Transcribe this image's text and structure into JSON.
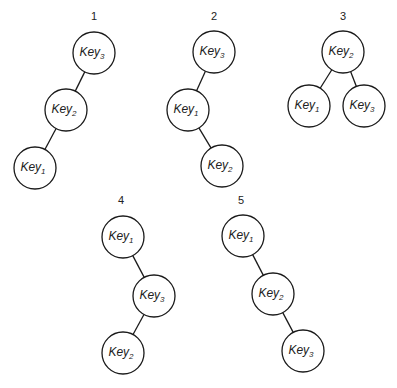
{
  "diagram": {
    "title": "",
    "node_radius": 21,
    "colors": {
      "stroke": "#1a1a1a",
      "fill": "#ffffff",
      "text": "#222222"
    },
    "trees": [
      {
        "label": "1",
        "label_pos": [
          94,
          20
        ],
        "nodes": [
          {
            "id": "k3",
            "text": "Key",
            "sub": "3",
            "x": 94,
            "y": 53
          },
          {
            "id": "k2",
            "text": "Key",
            "sub": "2",
            "x": 66,
            "y": 110
          },
          {
            "id": "k1",
            "text": "Key",
            "sub": "1",
            "x": 35,
            "y": 168
          }
        ],
        "edges": [
          [
            "k3",
            "k2"
          ],
          [
            "k2",
            "k1"
          ]
        ]
      },
      {
        "label": "2",
        "label_pos": [
          214,
          20
        ],
        "nodes": [
          {
            "id": "k3",
            "text": "Key",
            "sub": "3",
            "x": 214,
            "y": 52
          },
          {
            "id": "k1",
            "text": "Key",
            "sub": "1",
            "x": 188,
            "y": 110
          },
          {
            "id": "k2",
            "text": "Key",
            "sub": "2",
            "x": 222,
            "y": 166
          }
        ],
        "edges": [
          [
            "k3",
            "k1"
          ],
          [
            "k1",
            "k2"
          ]
        ]
      },
      {
        "label": "3",
        "label_pos": [
          343,
          20
        ],
        "nodes": [
          {
            "id": "k2",
            "text": "Key",
            "sub": "2",
            "x": 343,
            "y": 52
          },
          {
            "id": "k1",
            "text": "Key",
            "sub": "1",
            "x": 309,
            "y": 106
          },
          {
            "id": "k3",
            "text": "Key",
            "sub": "3",
            "x": 364,
            "y": 106
          }
        ],
        "edges": [
          [
            "k2",
            "k1"
          ],
          [
            "k2",
            "k3"
          ]
        ]
      },
      {
        "label": "4",
        "label_pos": [
          121,
          204
        ],
        "nodes": [
          {
            "id": "k1",
            "text": "Key",
            "sub": "1",
            "x": 123,
            "y": 237
          },
          {
            "id": "k3",
            "text": "Key",
            "sub": "3",
            "x": 154,
            "y": 296
          },
          {
            "id": "k2",
            "text": "Key",
            "sub": "2",
            "x": 123,
            "y": 353
          }
        ],
        "edges": [
          [
            "k1",
            "k3"
          ],
          [
            "k3",
            "k2"
          ]
        ]
      },
      {
        "label": "5",
        "label_pos": [
          241,
          204
        ],
        "nodes": [
          {
            "id": "k1",
            "text": "Key",
            "sub": "1",
            "x": 243,
            "y": 236
          },
          {
            "id": "k2",
            "text": "Key",
            "sub": "2",
            "x": 273,
            "y": 294
          },
          {
            "id": "k3",
            "text": "Key",
            "sub": "3",
            "x": 303,
            "y": 351
          }
        ],
        "edges": [
          [
            "k1",
            "k2"
          ],
          [
            "k2",
            "k3"
          ]
        ]
      }
    ]
  }
}
